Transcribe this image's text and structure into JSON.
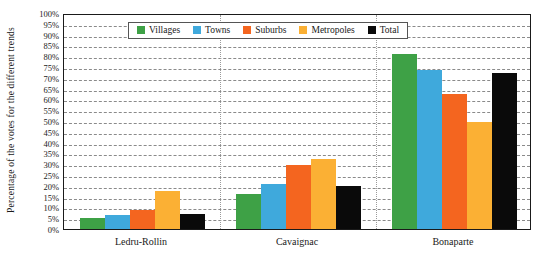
{
  "chart_data": {
    "type": "bar",
    "title": "",
    "xlabel": "",
    "ylabel": "Percentage of the votes for the different trends",
    "ylim": [
      0,
      100
    ],
    "ytick_labels": [
      "0%",
      "5%",
      "10%",
      "15%",
      "20%",
      "25%",
      "30%",
      "35%",
      "40%",
      "45%",
      "50%",
      "55%",
      "60%",
      "65%",
      "70%",
      "75%",
      "80%",
      "85%",
      "90%",
      "95%",
      "100%"
    ],
    "ytick_values": [
      0,
      5,
      10,
      15,
      20,
      25,
      30,
      35,
      40,
      45,
      50,
      55,
      60,
      65,
      70,
      75,
      80,
      85,
      90,
      95,
      100
    ],
    "grid": true,
    "legend_position": "top-center",
    "categories": [
      "Ledru-Rollin",
      "Cavaignac",
      "Bonaparte"
    ],
    "series": [
      {
        "name": "Villages",
        "color": "#3ea146",
        "values": [
          5,
          16,
          81
        ]
      },
      {
        "name": "Towns",
        "color": "#3fa9dc",
        "values": [
          6.5,
          21,
          73.5
        ]
      },
      {
        "name": "Suburbs",
        "color": "#f4651f",
        "values": [
          9,
          29.5,
          62.5
        ]
      },
      {
        "name": "Metropoles",
        "color": "#fbb034",
        "values": [
          17.5,
          32.5,
          49.5
        ]
      },
      {
        "name": "Total",
        "color": "#0a0a0a",
        "values": [
          7,
          20,
          72
        ]
      }
    ]
  }
}
